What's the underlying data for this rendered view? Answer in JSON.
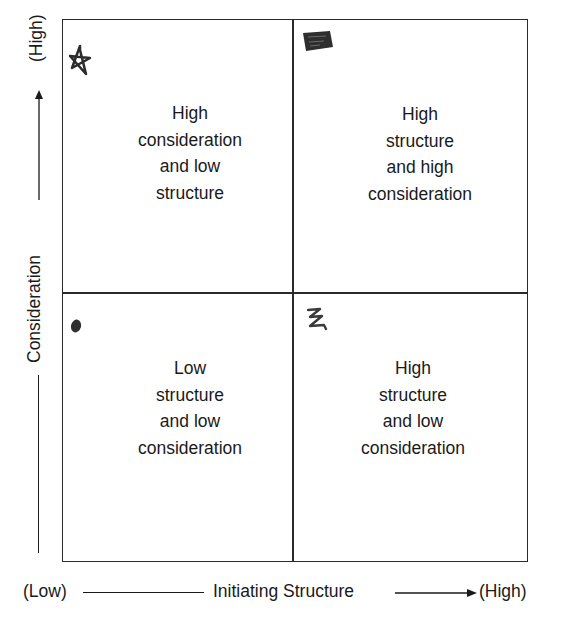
{
  "diagram": {
    "type": "2x2 matrix",
    "quadrants": {
      "top_left": {
        "label": "High\nconsideration\nand low\nstructure",
        "marker": "star-scribble-icon"
      },
      "top_right": {
        "label": "High\nstructure\nand high\nconsideration",
        "marker": "scribble-block-icon"
      },
      "bottom_left": {
        "label": "Low\nstructure\nand low\nconsideration",
        "marker": "dot-icon"
      },
      "bottom_right": {
        "label": "High\nstructure\nand low\nconsideration",
        "marker": "z-scribble-icon"
      }
    },
    "y_axis": {
      "label": "Consideration",
      "high": "(High)"
    },
    "x_axis": {
      "label": "Initiating Structure",
      "low": "(Low)",
      "high": "(High)"
    },
    "colors": {
      "line": "#2a2a2a",
      "text": "#1a1a1a",
      "background": "#ffffff"
    }
  }
}
